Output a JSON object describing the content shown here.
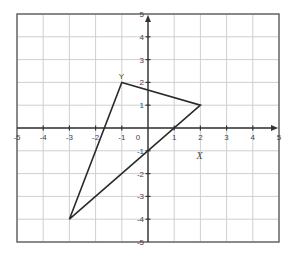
{
  "chart_data": {
    "type": "scatter",
    "title": "",
    "xlabel": "X",
    "ylabel": "Y",
    "xlim": [
      -5,
      5
    ],
    "ylim": [
      -5,
      5
    ],
    "grid": true,
    "x_ticks": [
      -5,
      -4,
      -3,
      -2,
      -1,
      0,
      1,
      2,
      3,
      4,
      5
    ],
    "y_ticks": [
      -5,
      -4,
      -3,
      -2,
      -1,
      1,
      2,
      3,
      4,
      5
    ],
    "x_tick_labels": [
      "-5",
      "-4",
      "-3",
      "-2",
      "-1",
      "0",
      "1",
      "2",
      "3",
      "4",
      "5"
    ],
    "y_tick_labels": [
      "-5",
      "-4",
      "-3",
      "-2",
      "-1",
      "1",
      "2",
      "3",
      "4",
      "5"
    ],
    "series": [
      {
        "name": "triangle",
        "closed": true,
        "points": [
          {
            "x": -1,
            "y": 2
          },
          {
            "x": 2,
            "y": 1
          },
          {
            "x": -3,
            "y": -4
          }
        ]
      }
    ],
    "annotations": [
      {
        "text": "Y",
        "x": -1,
        "y": 2,
        "role": "y-axis-label-near-vertex"
      },
      {
        "text": "X",
        "x": 2,
        "y": -1,
        "role": "x-axis-label"
      }
    ]
  },
  "layout": {
    "plot_left": 17,
    "plot_top": 14,
    "plot_right": 279,
    "plot_bottom": 242,
    "colors": {
      "grid": "#cfcfcf",
      "frame": "#6b6b6b",
      "axis": "#333333",
      "shape": "#2a2a2a",
      "text": "#444444"
    }
  }
}
